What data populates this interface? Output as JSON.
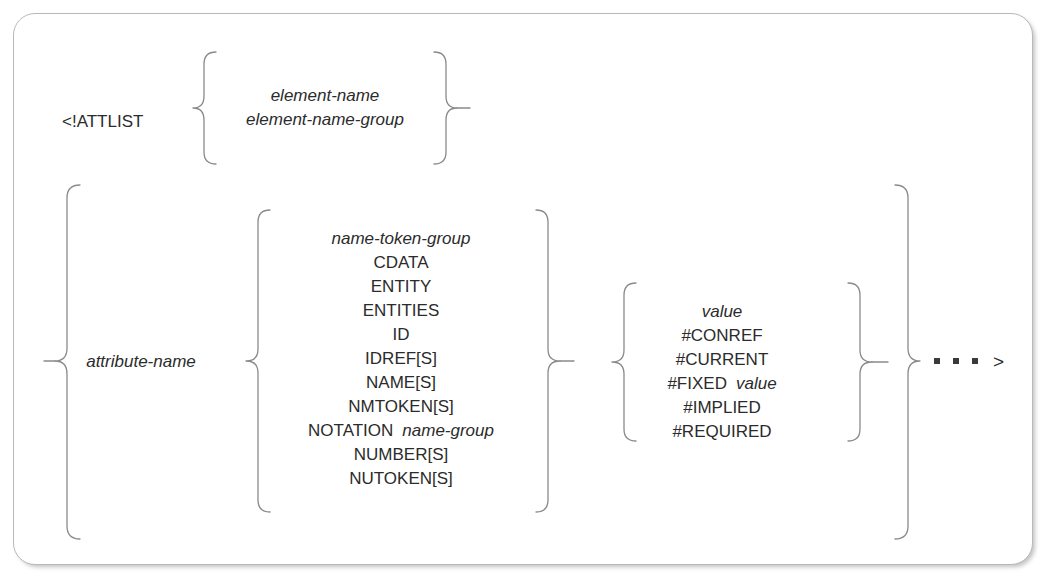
{
  "diagram": {
    "keyword": "<!ATTLIST",
    "terminator": ">",
    "repeat_indicator": "...",
    "stroke_color": "#8a8a8a",
    "text_color": "#2b2b2b",
    "border_color": "#b9b9b9",
    "background": "#ffffff",
    "groups": {
      "element_spec": {
        "name": "element-specification",
        "options": [
          {
            "text": "element-name",
            "style": "italic"
          },
          {
            "text": "element-name-group",
            "style": "italic"
          }
        ]
      },
      "attribute_name": {
        "label": "attribute-name",
        "style": "italic"
      },
      "declared_value": {
        "name": "declared-value",
        "options": [
          {
            "text": "name-token-group",
            "style": "italic"
          },
          {
            "text": "CDATA",
            "style": "upright"
          },
          {
            "text": "ENTITY",
            "style": "upright"
          },
          {
            "text": "ENTITIES",
            "style": "upright"
          },
          {
            "text": "ID",
            "style": "upright"
          },
          {
            "text": "IDREF[S]",
            "style": "upright"
          },
          {
            "text": "NAME[S]",
            "style": "upright"
          },
          {
            "text": "NMTOKEN[S]",
            "style": "upright"
          },
          {
            "text": "NOTATION",
            "style": "upright",
            "operand": "name-group",
            "operand_style": "italic"
          },
          {
            "text": "NUMBER[S]",
            "style": "upright"
          },
          {
            "text": "NUTOKEN[S]",
            "style": "upright"
          }
        ]
      },
      "default_value": {
        "name": "default-value",
        "options": [
          {
            "text": "value",
            "style": "italic"
          },
          {
            "text": "#CONREF",
            "style": "upright"
          },
          {
            "text": "#CURRENT",
            "style": "upright"
          },
          {
            "text": "#FIXED",
            "style": "upright",
            "operand": "value",
            "operand_style": "italic"
          },
          {
            "text": "#IMPLIED",
            "style": "upright"
          },
          {
            "text": "#REQUIRED",
            "style": "upright"
          }
        ]
      }
    }
  }
}
